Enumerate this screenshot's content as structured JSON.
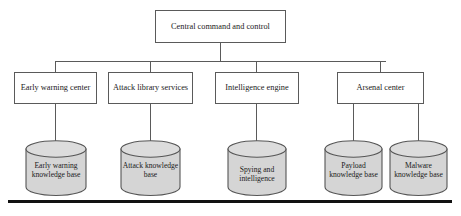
{
  "diagram": {
    "colors": {
      "background": "#ffffff",
      "box_stroke": "#5a5a5a",
      "box_fill": "#ffffff",
      "cylinder_fill": "#d5d5d5",
      "cylinder_top_fill": "#dcdcdc",
      "cylinder_stroke": "#555555",
      "connector": "#5a5a5a",
      "text": "#1a1a1a",
      "rule": "#111111"
    },
    "root": {
      "label": "Central command and control"
    },
    "units": [
      {
        "label": "Early warning center"
      },
      {
        "label": "Attack library services"
      },
      {
        "label": "Intelligence engine"
      },
      {
        "label": "Arsenal center"
      }
    ],
    "knowledge_bases": [
      {
        "label": "Early warning knowledge base"
      },
      {
        "label": "Attack knowledge base"
      },
      {
        "label": "Spying and intelligence"
      },
      {
        "label": "Payload knowledge base"
      },
      {
        "label": "Malware knowledge base"
      }
    ]
  }
}
